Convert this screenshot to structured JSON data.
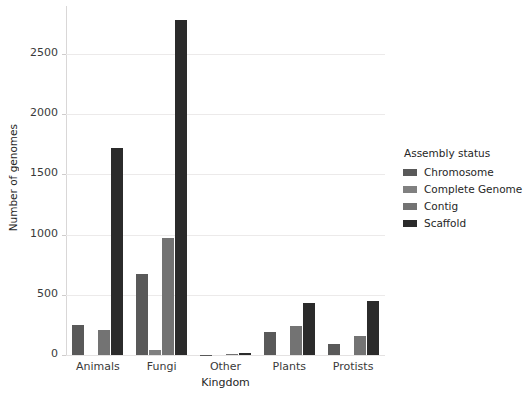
{
  "chart_data": {
    "type": "bar",
    "title": "",
    "xlabel": "Kingdom",
    "ylabel": "Number of genomes",
    "categories": [
      "Animals",
      "Fungi",
      "Other",
      "Plants",
      "Protists"
    ],
    "series": [
      {
        "name": "Chromosome",
        "color": "#595959",
        "values": [
          250,
          670,
          2,
          190,
          95
        ]
      },
      {
        "name": "Complete Genome",
        "color": "#808080",
        "values": [
          0,
          45,
          0,
          0,
          0
        ]
      },
      {
        "name": "Contig",
        "color": "#737373",
        "values": [
          210,
          970,
          10,
          240,
          160
        ]
      },
      {
        "name": "Scaffold",
        "color": "#2b2b2b",
        "values": [
          1720,
          2780,
          18,
          430,
          450
        ]
      }
    ],
    "ylim": [
      0,
      2900
    ],
    "yticks": [
      0,
      500,
      1000,
      1500,
      2000,
      2500
    ],
    "ytick_labels": [
      "0",
      "500",
      "1000",
      "1500",
      "2000",
      "2500"
    ],
    "grid": true,
    "legend_position": "right",
    "legend_title": "Assembly status"
  },
  "legend": {
    "title": "Assembly status",
    "entries": [
      {
        "label": "Chromosome",
        "color": "#595959"
      },
      {
        "label": "Complete Genome",
        "color": "#808080"
      },
      {
        "label": "Contig",
        "color": "#737373"
      },
      {
        "label": "Scaffold",
        "color": "#2b2b2b"
      }
    ]
  },
  "axes": {
    "y_title": "Number of genomes",
    "x_title": "Kingdom"
  }
}
